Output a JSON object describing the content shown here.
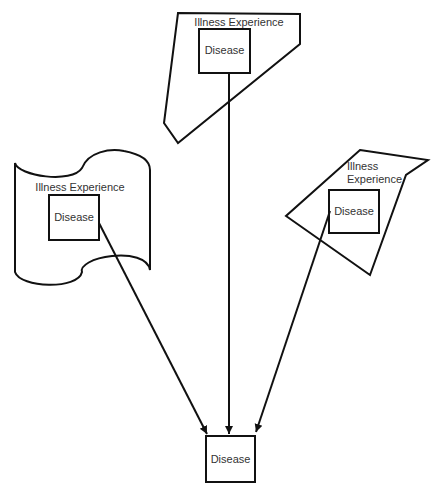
{
  "diagram": {
    "colors": {
      "stroke": "#111111",
      "text": "#333333",
      "background": "#ffffff"
    },
    "top_cluster": {
      "outer_label": "Illness Experience",
      "inner_label": "Disease"
    },
    "left_cluster": {
      "outer_label": "Illness Experience",
      "inner_label": "Disease"
    },
    "right_cluster": {
      "outer_label_line1": "Illness",
      "outer_label_line2": "Experience",
      "inner_label": "Disease"
    },
    "target": {
      "label": "Disease"
    },
    "edges": [
      {
        "from": "left_cluster.disease",
        "to": "target"
      },
      {
        "from": "top_cluster.disease",
        "to": "target"
      },
      {
        "from": "right_cluster.disease",
        "to": "target"
      }
    ]
  }
}
